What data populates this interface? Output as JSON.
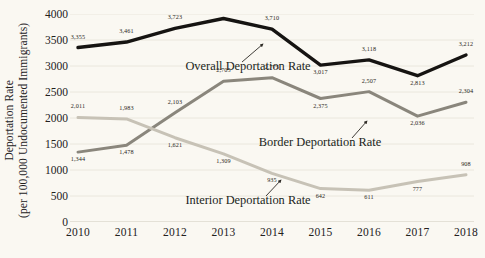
{
  "chart_data": {
    "type": "line",
    "title": "",
    "xlabel": "",
    "ylabel": "Deportation Rate (per 100,000 Undocumented Immigrants)",
    "ylabel_line1": "Deportation Rate",
    "ylabel_line2": "(per 100,000 Undocumented Immigrants)",
    "categories": [
      "2010",
      "2011",
      "2012",
      "2013",
      "2014",
      "2015",
      "2016",
      "2017",
      "2018"
    ],
    "x": [
      2010,
      2011,
      2012,
      2013,
      2014,
      2015,
      2016,
      2017,
      2018
    ],
    "ylim": [
      0,
      4000
    ],
    "yticks": [
      0,
      500,
      1000,
      1500,
      2000,
      2500,
      3000,
      3500,
      4000
    ],
    "ytick_labels": [
      "0",
      "500",
      "1000",
      "1500",
      "2000",
      "2500",
      "3000",
      "3500",
      "4000"
    ],
    "grid": true,
    "legend_position": "inline-annotations",
    "series": [
      {
        "name": "Overall Deportation Rate",
        "color": "#161412",
        "values": [
          3355,
          3461,
          3723,
          3914,
          3710,
          3017,
          3118,
          2813,
          3212
        ],
        "labels": [
          "3,355",
          "3,461",
          "3,723",
          "3,914",
          "3,710",
          "3,017",
          "3,118",
          "2,813",
          "3,212"
        ]
      },
      {
        "name": "Border Deportation Rate",
        "color": "#8a867c",
        "values": [
          1344,
          1478,
          2103,
          2705,
          2775,
          2375,
          2507,
          2036,
          2304
        ],
        "labels": [
          "1,344",
          "1,478",
          "2,103",
          "2,705",
          "2,775",
          "2,375",
          "2,507",
          "2,036",
          "2,304"
        ]
      },
      {
        "name": "Interior Deportation Rate",
        "color": "#c7c2b6",
        "values": [
          2011,
          1983,
          1621,
          1309,
          935,
          642,
          611,
          777,
          908
        ],
        "labels": [
          "2,011",
          "1,983",
          "1,621",
          "1,309",
          "935",
          "642",
          "611",
          "777",
          "908"
        ]
      }
    ],
    "annotations": [
      {
        "name": "overall-label",
        "text": "Overall Deportation Rate"
      },
      {
        "name": "border-label",
        "text": "Border Deportation Rate"
      },
      {
        "name": "interior-label",
        "text": "Interior Deportation Rate"
      }
    ],
    "colors": {
      "background": "#faf8f2",
      "grid": "#e6e2d8",
      "axis": "#cfcabd",
      "text": "#23211d"
    }
  }
}
